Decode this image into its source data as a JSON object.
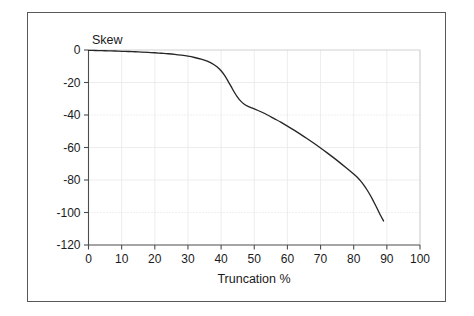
{
  "figure": {
    "frame_color": "#595959",
    "background": "#ffffff"
  },
  "chart_data": {
    "type": "line",
    "title": "",
    "subtitle": "",
    "xlabel": "Truncation %",
    "ylabel": "Skew",
    "ylabel_placement": "top-left-inside",
    "xlim": [
      0,
      100
    ],
    "ylim": [
      -120,
      0
    ],
    "xticks": [
      0,
      10,
      20,
      30,
      40,
      50,
      60,
      70,
      80,
      90,
      100
    ],
    "yticks": [
      0,
      -20,
      -40,
      -60,
      -80,
      -100,
      -120
    ],
    "xtick_labels": [
      "0",
      "10",
      "20",
      "30",
      "40",
      "50",
      "60",
      "70",
      "80",
      "90",
      "100"
    ],
    "ytick_labels": [
      "0",
      "-20",
      "-40",
      "-60",
      "-80",
      "-100",
      "-120"
    ],
    "grid": true,
    "grid_style": "faint",
    "legend": false,
    "legend_position": "none",
    "line_color": "#262626",
    "series": [
      {
        "name": "Skew",
        "x": [
          0,
          2,
          4,
          6,
          8,
          10,
          12,
          14,
          16,
          18,
          20,
          22,
          24,
          26,
          28,
          30,
          32,
          34,
          36,
          38,
          39,
          40,
          41,
          42,
          43,
          44,
          45,
          46,
          47,
          48,
          49,
          50,
          52,
          54,
          56,
          58,
          60,
          62,
          64,
          66,
          68,
          70,
          72,
          74,
          76,
          78,
          80,
          81,
          82,
          83,
          84,
          85,
          86,
          87,
          88,
          89
        ],
        "y": [
          -0.2,
          -0.3,
          -0.4,
          -0.5,
          -0.6,
          -0.8,
          -0.9,
          -1.1,
          -1.3,
          -1.5,
          -1.7,
          -2.0,
          -2.3,
          -2.7,
          -3.2,
          -3.8,
          -4.6,
          -5.6,
          -7.0,
          -9.2,
          -10.8,
          -12.8,
          -15.5,
          -18.8,
          -22.4,
          -26.0,
          -29.2,
          -31.6,
          -33.4,
          -34.6,
          -35.4,
          -36.2,
          -38.0,
          -40.0,
          -42.2,
          -44.4,
          -46.8,
          -49.3,
          -51.9,
          -54.6,
          -57.4,
          -60.3,
          -63.3,
          -66.4,
          -69.6,
          -72.9,
          -76.3,
          -78.2,
          -80.4,
          -83.0,
          -86.0,
          -89.4,
          -93.2,
          -97.2,
          -101.4,
          -105.2
        ]
      }
    ]
  },
  "axes": {
    "y_axis_label": "Skew",
    "x_axis_label": "Truncation %"
  }
}
